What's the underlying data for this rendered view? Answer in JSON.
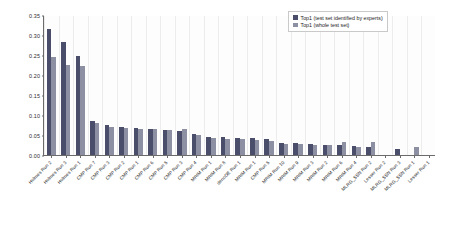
{
  "chart_data": {
    "type": "bar",
    "title": "",
    "xlabel": "",
    "ylabel": "",
    "ylim": [
      0.0,
      0.35
    ],
    "ytick_labels": [
      "0.00",
      "0.05",
      "0.10",
      "0.15",
      "0.20",
      "0.25",
      "0.30",
      "0.35"
    ],
    "ytick_values": [
      0.0,
      0.05,
      0.1,
      0.15,
      0.2,
      0.25,
      0.3,
      0.35
    ],
    "grid": false,
    "legend_position": "top-right",
    "categories": [
      "Holmes Run 2",
      "Holmes Run 3",
      "Holmes Run 1",
      "CMP Run 7",
      "CMP Run 3",
      "CMP Run 2",
      "CMP Run 1",
      "CMP Run 6",
      "CMP Run 5",
      "CMP Run 3",
      "CMP Run 4",
      "MRIM Run 1",
      "MRIM Run 8",
      "denoDE Run 1",
      "MRIM Run 1",
      "CMP Run 5",
      "MRIM Run 10",
      "MRIM Run 9",
      "MRIM Run 3",
      "MRIM Run 2",
      "MRIM Run 6",
      "MRIM Run 4",
      "MLRG_SSN Run 2",
      "Lesser Run 2",
      "MLRG_SSN Run 3",
      "MLRG_SSN Run 1",
      "Lesser Run 1"
    ],
    "series": [
      {
        "name": "Top1 (test set identified by experts)",
        "color": "#4a4e6b",
        "values": [
          0.316,
          0.282,
          0.248,
          0.085,
          0.075,
          0.069,
          0.068,
          0.066,
          0.063,
          0.061,
          0.052,
          0.046,
          0.044,
          0.043,
          0.042,
          0.039,
          0.03,
          0.029,
          0.028,
          0.026,
          0.024,
          0.022,
          0.02,
          0.0,
          0.016,
          0.0,
          0.0
        ]
      },
      {
        "name": "Top1 (whole test set)",
        "color": "#8d90a3",
        "values": [
          0.245,
          0.226,
          0.223,
          0.079,
          0.071,
          0.068,
          0.066,
          0.064,
          0.062,
          0.065,
          0.05,
          0.043,
          0.041,
          0.04,
          0.038,
          0.034,
          0.028,
          0.027,
          0.026,
          0.024,
          0.033,
          0.02,
          0.032,
          0.0,
          0.0,
          0.021,
          0.0
        ]
      }
    ]
  },
  "legend": {
    "items": [
      {
        "label": "Top1 (test set identified by experts)"
      },
      {
        "label": "Top1 (whole test set)"
      }
    ]
  }
}
